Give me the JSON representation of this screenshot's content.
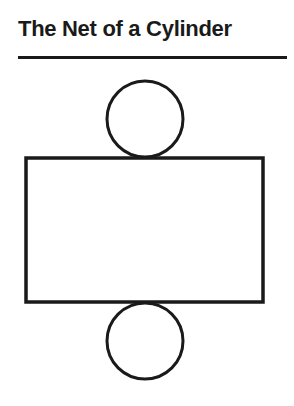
{
  "title": "The Net of a Cylinder",
  "colors": {
    "stroke": "#1a1a1a",
    "background": "#ffffff"
  },
  "diagram": {
    "type": "cylinder-net",
    "parts": [
      {
        "name": "top-base",
        "shape": "circle"
      },
      {
        "name": "lateral-surface",
        "shape": "rectangle"
      },
      {
        "name": "bottom-base",
        "shape": "circle"
      }
    ]
  }
}
